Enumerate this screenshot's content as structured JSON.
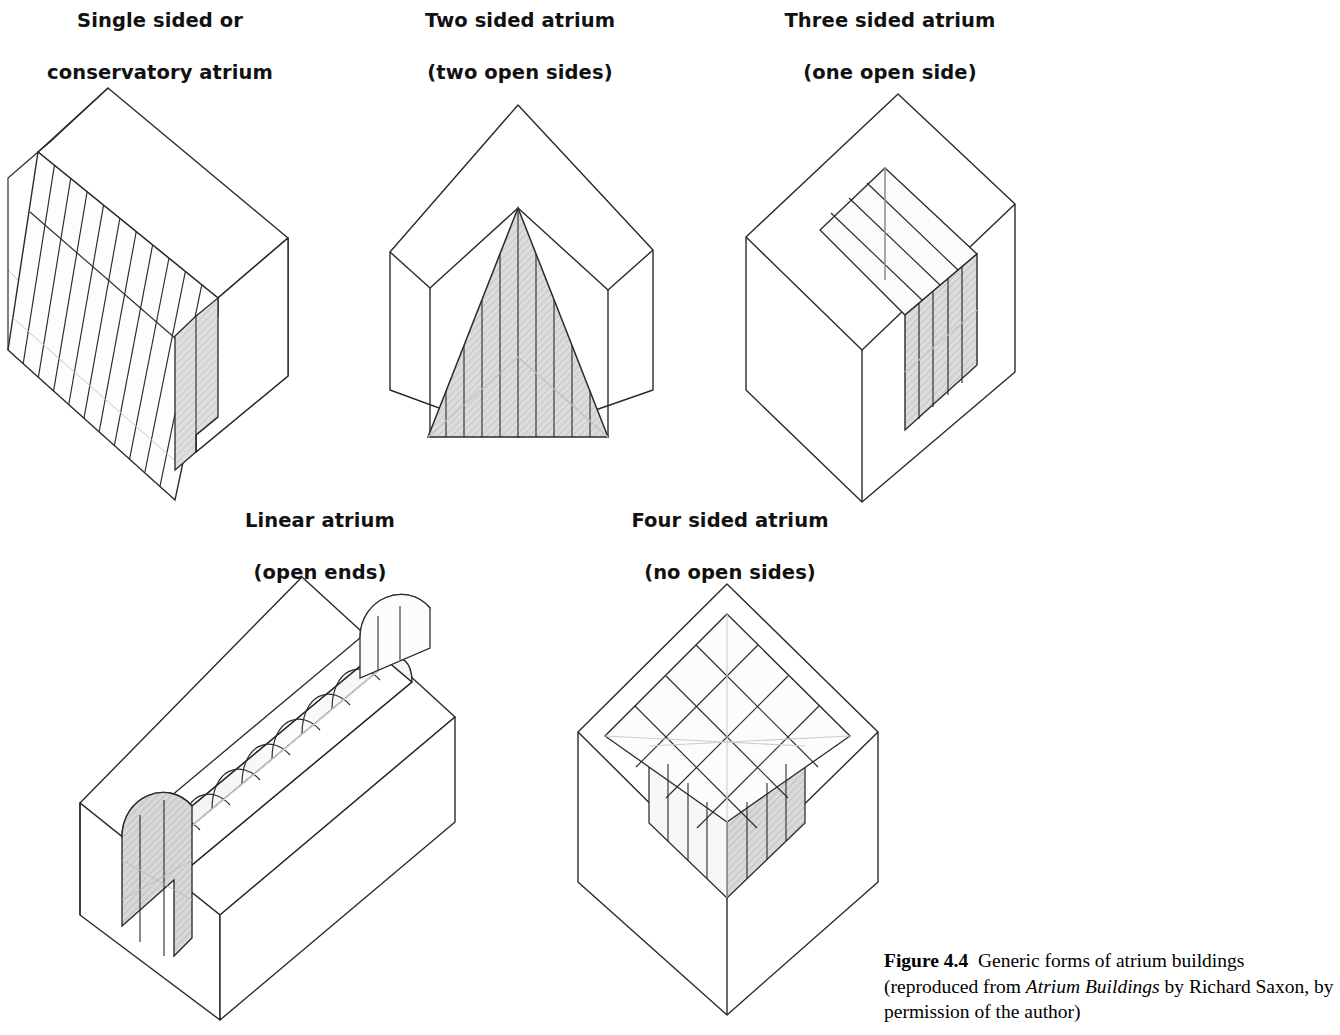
{
  "figure": {
    "number": "Figure 4.4",
    "title_text": "Generic forms of atrium buildings",
    "source_prefix": "(reproduced from ",
    "source_title": "Atrium Buildings",
    "source_suffix": " by Richard Saxon, by permission of the author)"
  },
  "colors": {
    "background": "#ffffff",
    "stroke_strong": "#1a1a1a",
    "stroke_medium": "#4a4a4a",
    "stroke_faint": "#b9b9b9",
    "glass_shade": "#d2d2d2",
    "glass_light": "#f2f2f2",
    "text": "#111111"
  },
  "diagrams": [
    {
      "id": "single-sided",
      "label_line1": "Single sided or",
      "label_line2": "conservatory atrium",
      "label_x": 20,
      "label_y": 8,
      "label_w": 280,
      "mullions": 11,
      "description": "Isometric block with sloping glazed conservatory roof on the front-left face and a shaded glazed end wall"
    },
    {
      "id": "two-sided",
      "label_line1": "Two sided atrium",
      "label_line2": "(two open sides)",
      "label_x": 380,
      "label_y": 8,
      "label_w": 280,
      "mullions": 9,
      "description": "Isometric cube with a shaded triangular glazed atrium rising to an apex between two open sides"
    },
    {
      "id": "three-sided",
      "label_line1": "Three sided atrium",
      "label_line2": "(one open side)",
      "label_x": 750,
      "label_y": 8,
      "label_w": 280,
      "roof_ribs": 5,
      "wall_mullions": 5,
      "description": "Isometric cube with a notched corner, ribbed glazed roof and a shaded glazed wall on the open side"
    },
    {
      "id": "linear",
      "label_line1": "Linear atrium",
      "label_line2": "(open ends)",
      "label_x": 180,
      "label_y": 508,
      "label_w": 280,
      "vault_bays": 8,
      "description": "Rectangular block with a barrel vaulted glazed roof running the full length, open at both ends"
    },
    {
      "id": "four-sided",
      "label_line1": "Four sided atrium",
      "label_line2": "(no open sides)",
      "label_x": 590,
      "label_y": 508,
      "label_w": 280,
      "grid": 4,
      "description": "Isometric cube with a square gridded lantern rooflight set into the roof, enclosed on all four sides"
    }
  ]
}
